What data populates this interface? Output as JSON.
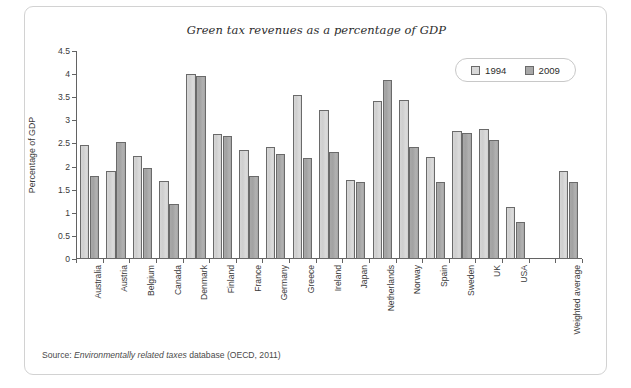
{
  "chart_data": {
    "type": "bar",
    "title": "Green tax revenues as a percentage of GDP",
    "xlabel": "",
    "ylabel": "Percentage of GDP",
    "ylim": [
      0,
      4.5
    ],
    "ytick_step": 0.5,
    "yticks": [
      "0",
      "0.5",
      "1",
      "1.5",
      "2",
      "2.5",
      "3",
      "3.5",
      "4",
      "4.5"
    ],
    "grid": false,
    "legend_position": "top-right",
    "categories": [
      "Australia",
      "Austria",
      "Belgium",
      "Canada",
      "Denmark",
      "Finland",
      "France",
      "Germany",
      "Greece",
      "Ireland",
      "Japan",
      "Netherlands",
      "Norway",
      "Spain",
      "Sweden",
      "UK",
      "USA",
      "",
      "Weighted average"
    ],
    "series": [
      {
        "name": "1994",
        "color": "#d8d8d8",
        "values": [
          2.47,
          1.91,
          2.23,
          1.68,
          4.01,
          2.7,
          2.36,
          2.43,
          3.54,
          3.22,
          1.71,
          3.41,
          3.45,
          2.21,
          2.78,
          2.82,
          1.13,
          null,
          1.9
        ]
      },
      {
        "name": "2009",
        "color": "#a8a8a8",
        "values": [
          1.79,
          2.53,
          1.97,
          1.19,
          3.97,
          2.67,
          1.79,
          2.28,
          2.18,
          2.32,
          1.66,
          3.88,
          2.42,
          1.66,
          2.73,
          2.58,
          0.8,
          null,
          1.66
        ]
      }
    ]
  },
  "source": {
    "prefix": "Source: ",
    "emphasis": "Environmentally related taxes",
    "suffix": " database (OECD, 2011)"
  }
}
